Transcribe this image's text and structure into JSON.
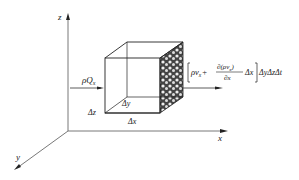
{
  "axes": {
    "z_label": "z",
    "x_label": "x",
    "y_label": "y"
  },
  "inflow": {
    "label_rho": "ρ",
    "label_Q": "Q",
    "label_sub": "x"
  },
  "outflow_formula": {
    "bracket_open": "[",
    "term1": "ρv",
    "term1_sub": "x",
    "plus": "+",
    "numerator": "∂(ρv",
    "numerator_sub": "x",
    "numerator_close": ")",
    "denominator": "∂x",
    "delta_x": "Δx",
    "bracket_close": "]",
    "tail": "ΔyΔzΔt"
  },
  "cube_dims": {
    "dz": "Δz",
    "dy": "Δy",
    "dx": "Δx"
  },
  "colors": {
    "line": "#222222",
    "axis": "#555555",
    "hatch": "#333333"
  }
}
